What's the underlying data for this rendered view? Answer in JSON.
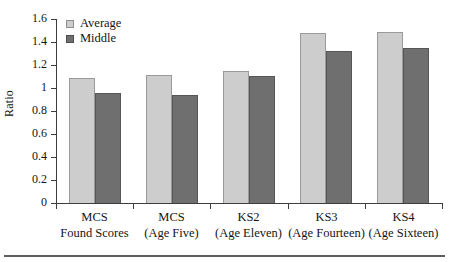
{
  "chart_data": {
    "type": "bar",
    "title": "",
    "xlabel": "",
    "ylabel": "Ratio",
    "ylim": [
      0,
      1.6
    ],
    "yticks": [
      "0",
      "0.2",
      "0.4",
      "0.6",
      "0.8",
      "1",
      "1.2",
      "1.4",
      "1.6"
    ],
    "ytick_values": [
      0,
      0.2,
      0.4,
      0.6,
      0.8,
      1.0,
      1.2,
      1.4,
      1.6
    ],
    "grid": false,
    "legend_position": "top-left-inside",
    "categories": [
      "MCS Found Scores",
      "MCS (Age Five)",
      "KS2 (Age Eleven)",
      "KS3 (Age Fourteen)",
      "KS4 (Age Sixteen)"
    ],
    "category_lines": [
      {
        "line1": "MCS",
        "line2": "Found Scores"
      },
      {
        "line1": "MCS",
        "line2": "(Age Five)"
      },
      {
        "line1": "KS2",
        "line2": "(Age Eleven)"
      },
      {
        "line1": "KS3",
        "line2": "(Age Fourteen)"
      },
      {
        "line1": "KS4",
        "line2": "(Age Sixteen)"
      }
    ],
    "series": [
      {
        "name": "Average",
        "color": "#cdcdcd",
        "values": [
          1.09,
          1.11,
          1.15,
          1.48,
          1.49
        ]
      },
      {
        "name": "Middle",
        "color": "#6f6f6f",
        "values": [
          0.96,
          0.94,
          1.1,
          1.32,
          1.35
        ]
      }
    ]
  },
  "legend": {
    "items": [
      {
        "label": "Average",
        "swatch": "light-gray"
      },
      {
        "label": "Middle",
        "swatch": "dark-gray"
      }
    ]
  },
  "colors": {
    "average_bar": "#cdcdcd",
    "middle_bar": "#6f6f6f",
    "axis": "#3d3d3d",
    "text": "#151515",
    "background": "#ffffff",
    "bottom_rule": "#5d5d5d"
  }
}
